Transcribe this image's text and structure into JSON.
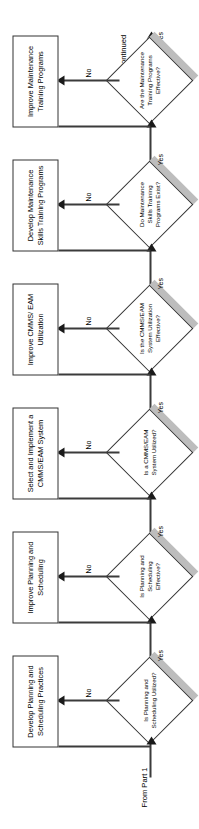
{
  "diagram": {
    "orientation": "rotated-90-ccw",
    "entry_label": "From Part 1",
    "exit_label": "Continued",
    "yes_label": "Yes",
    "no_label": "No",
    "colors": {
      "line": "#3b3b3b",
      "box_border": "#333333",
      "box_fill": "#ffffff",
      "shadow": "#bdbdbd",
      "arrow": "#1a1a1a",
      "text": "#000000",
      "background": "#ffffff"
    },
    "stages": [
      {
        "id": "planning-utilized",
        "decision": "Is Planning and Scheduling Utilized?",
        "no_action": "Develop Planning and Scheduling Practices",
        "yes_label": "Yes",
        "no_label": "No"
      },
      {
        "id": "planning-effective",
        "decision": "Is Planning and Scheduling Effective?",
        "no_action": "Improve Planning and Scheduling",
        "yes_label": "Yes",
        "no_label": "No"
      },
      {
        "id": "cmms-utilized",
        "decision": "Is a CMMS/EAM System Utilized?",
        "no_action": "Select and Implement a CMMS/EAM System",
        "yes_label": "Yes",
        "no_label": "No"
      },
      {
        "id": "cmms-effective",
        "decision": "Is the CMMS/EAM System Utilization Effective?",
        "no_action": "Improve CMMS/ EAM Utilization",
        "yes_label": "Yes",
        "no_label": "No"
      },
      {
        "id": "training-exists",
        "decision": "Do Maintenance Skills Training Programs Exist?",
        "no_action": "Develop Maintenance Skills Training Programs",
        "yes_label": "Yes",
        "no_label": "No"
      },
      {
        "id": "training-effective",
        "decision": "Are the Maintenance Training Programs Effective?",
        "no_action": "Improve Maintenance Training Programs",
        "yes_label": "Yes",
        "no_label": "No"
      }
    ]
  }
}
